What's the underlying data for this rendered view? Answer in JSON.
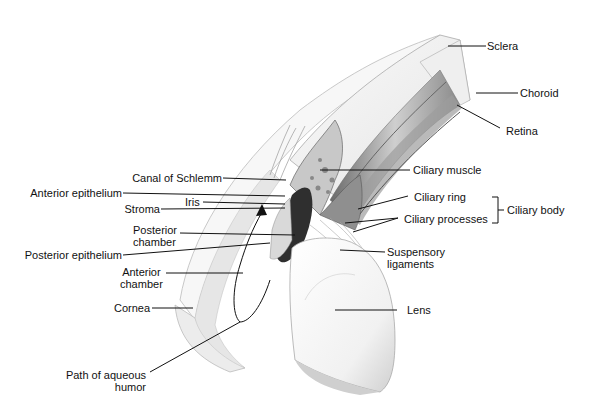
{
  "labels": {
    "sclera": "Sclera",
    "choroid": "Choroid",
    "retina": "Retina",
    "canal_of_schlemm": "Canal of Schlemm",
    "ciliary_muscle": "Ciliary muscle",
    "anterior_epithelium": "Anterior epithelium",
    "iris": "Iris",
    "stroma": "Stroma",
    "ciliary_ring": "Ciliary ring",
    "ciliary_processes": "Ciliary processes",
    "ciliary_body": "Ciliary body",
    "posterior_chamber_1": "Posterior",
    "posterior_chamber_2": "chamber",
    "posterior_epithelium": "Posterior epithelium",
    "suspensory_ligaments_1": "Suspensory",
    "suspensory_ligaments_2": "ligaments",
    "anterior_chamber_1": "Anterior",
    "anterior_chamber_2": "chamber",
    "cornea": "Cornea",
    "lens": "Lens",
    "path_aqueous_1": "Path of aqueous",
    "path_aqueous_2": "humor"
  },
  "colors": {
    "line": "#111111",
    "tissue_light": "#eeeeee",
    "tissue_mid": "#bdbdbd",
    "tissue_dark": "#3a3a3a"
  }
}
